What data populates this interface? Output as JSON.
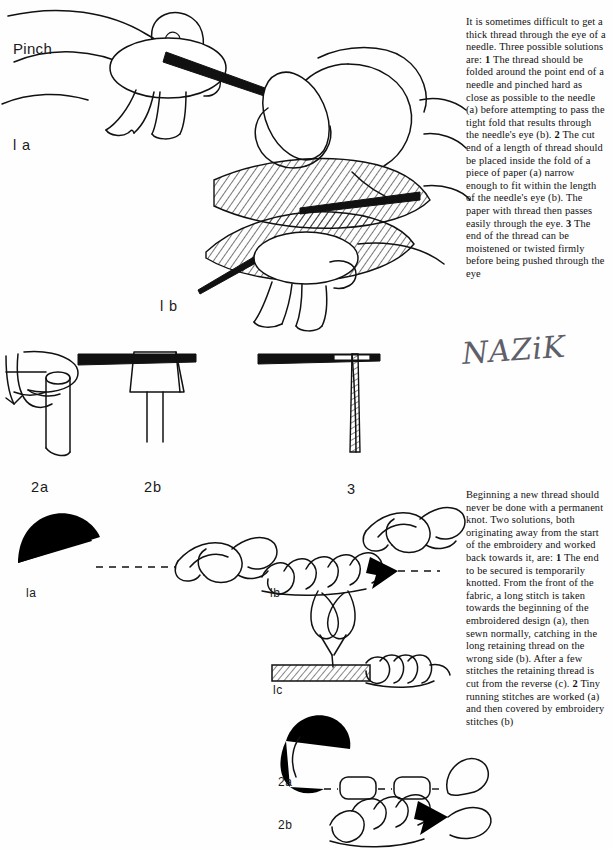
{
  "page": {
    "kind": "scanned-book-page",
    "width": 613,
    "height": 849,
    "background_color": "#ffffff",
    "ink_color": "#111111"
  },
  "text_blocks": {
    "threading_a_needle": "It is sometimes difficult to get a thick thread through the eye of a needle. Three possible solutions are: 1 The thread should be folded around the point end of a needle and pinched hard as close as possible to the needle (a) before attempting to pass the tight fold that results through the needle's eye (b). 2 The cut end of a length of thread should be placed inside the fold of a piece of paper (a) narrow enough to fit within the length of the needle's eye (b). The paper with thread then passes easily through the eye. 3 The end of the thread can be moistened or twisted firmly before being pushed through the eye",
    "starting_a_thread": "Beginning a new thread should never be done with a permanent knot. Two solutions, both originating away from the start of the embroidery and worked back towards it, are: 1 The end to be secured is temporarily knotted. From the front of the fabric, a long stitch is taken towards the beginning of the embroidered design (a), then sewn normally, catching in the long retaining thread on the wrong side (b). After a few stitches the retaining thread is cut from the reverse (c). 2 Tiny running stitches are worked (a) and then covered by embroidery stitches (b)"
  },
  "callouts": {
    "pinch": "Pinch"
  },
  "figure_labels": {
    "hand_1a": "l a",
    "hand_1b": "l b",
    "needle_2a": "2a",
    "needle_2b": "2b",
    "needle_3": "3",
    "thread_1a": "la",
    "thread_1b": "lb",
    "thread_1c": "lc",
    "thread_2a": "2a",
    "thread_2b": "2b"
  },
  "annotations": {
    "handwritten_signature": "NAZiK"
  }
}
